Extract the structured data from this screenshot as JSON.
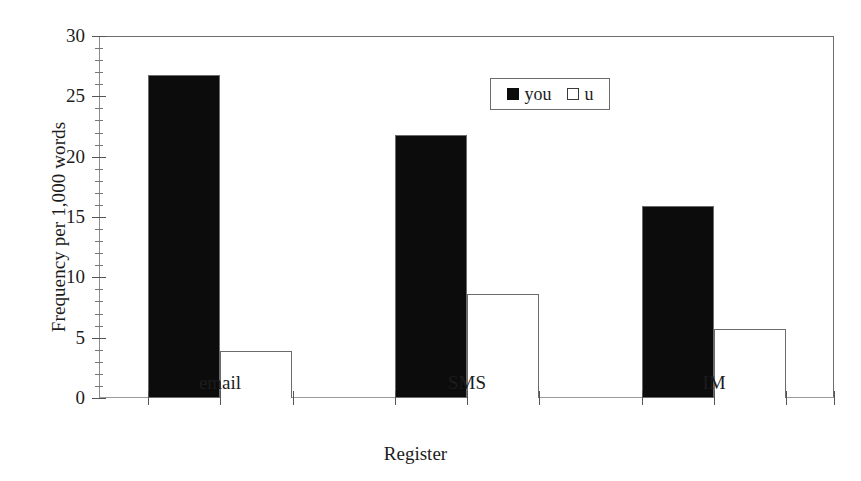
{
  "chart_data": {
    "type": "bar",
    "title": "",
    "xlabel": "Register",
    "ylabel": "Frequency per 1,000 words",
    "categories": [
      "email",
      "SMS",
      "IM"
    ],
    "series": [
      {
        "name": "you",
        "values": [
          26.8,
          21.8,
          15.9
        ],
        "color": "#0c0c0c",
        "swatch": "filled-square"
      },
      {
        "name": "u",
        "values": [
          3.9,
          8.6,
          5.7
        ],
        "color": "#ffffff",
        "swatch": "open-square"
      }
    ],
    "ylim": [
      0,
      30
    ],
    "yticks": [
      0,
      5,
      10,
      15,
      20,
      25,
      30
    ],
    "ytick_labels": [
      "0",
      "5",
      "10",
      "15",
      "20",
      "25",
      "30"
    ],
    "minor_tick_interval": 1,
    "grid": false,
    "legend_position": "upper-center",
    "legend_entries": [
      "you",
      "u"
    ]
  },
  "axis": {
    "y_title": "Frequency per 1,000 words",
    "x_title": "Register",
    "y_labels": [
      "30",
      "25",
      "20",
      "15",
      "10",
      "5",
      "0"
    ],
    "x_labels": [
      "email",
      "SMS",
      "IM"
    ]
  },
  "legend": {
    "items": [
      {
        "label": "you",
        "swatch": "filled-square-icon"
      },
      {
        "label": "u",
        "swatch": "open-square-icon"
      }
    ]
  }
}
